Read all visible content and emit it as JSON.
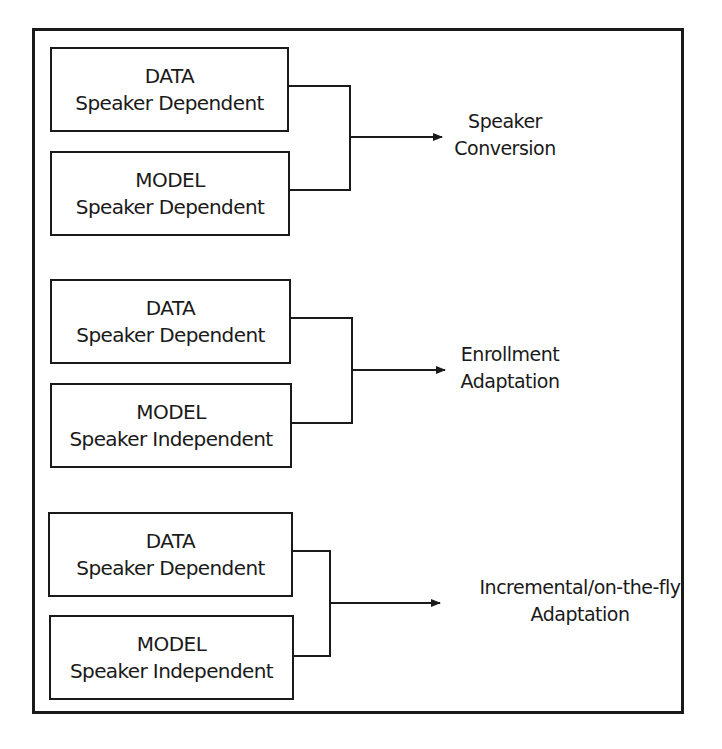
{
  "diagram": {
    "groups": [
      {
        "data_box": {
          "title": "DATA",
          "subtitle": "Speaker Dependent"
        },
        "model_box": {
          "title": "MODEL",
          "subtitle": "Speaker Dependent"
        },
        "output": {
          "line1": "Speaker",
          "line2": "Conversion"
        }
      },
      {
        "data_box": {
          "title": "DATA",
          "subtitle": "Speaker Dependent"
        },
        "model_box": {
          "title": "MODEL",
          "subtitle": "Speaker Independent"
        },
        "output": {
          "line1": "Enrollment",
          "line2": "Adaptation"
        }
      },
      {
        "data_box": {
          "title": "DATA",
          "subtitle": "Speaker Dependent"
        },
        "model_box": {
          "title": "MODEL",
          "subtitle": "Speaker Independent"
        },
        "output": {
          "line1": "Incremental/on-the-fly",
          "line2": "Adaptation"
        }
      }
    ],
    "colors": {
      "stroke": "#1a1a1a",
      "background": "#ffffff"
    }
  }
}
